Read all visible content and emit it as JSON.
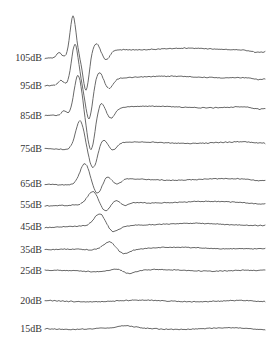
{
  "chart_data": {
    "type": "line",
    "title": "",
    "xlabel": "",
    "ylabel": "",
    "grid": false,
    "legend": "none",
    "series": [
      {
        "name": "105dB",
        "baseline_y": 58,
        "peak_x": 73,
        "peak_y": 17,
        "trough_x": 86,
        "trough_y": 92
      },
      {
        "name": "95dB",
        "baseline_y": 86,
        "peak_x": 75,
        "peak_y": 45,
        "trough_x": 89,
        "trough_y": 120
      },
      {
        "name": "85dB",
        "baseline_y": 116,
        "peak_x": 78,
        "peak_y": 75,
        "trough_x": 91,
        "trough_y": 150
      },
      {
        "name": "75dB",
        "baseline_y": 149,
        "peak_x": 80,
        "peak_y": 120,
        "trough_x": 93,
        "trough_y": 168
      },
      {
        "name": "65dB",
        "baseline_y": 184,
        "peak_x": 85,
        "peak_y": 163,
        "trough_x": 97,
        "trough_y": 195
      },
      {
        "name": "55dB",
        "baseline_y": 205,
        "peak_x": 93,
        "peak_y": 192,
        "trough_x": 105,
        "trough_y": 213
      },
      {
        "name": "45dB",
        "baseline_y": 227,
        "peak_x": 100,
        "peak_y": 214,
        "trough_x": 112,
        "trough_y": 233
      },
      {
        "name": "35dB",
        "baseline_y": 250,
        "peak_x": 110,
        "peak_y": 241,
        "trough_x": 122,
        "trough_y": 254
      },
      {
        "name": "25dB",
        "baseline_y": 271,
        "peak_x": 117,
        "peak_y": 268,
        "trough_x": 128,
        "trough_y": 274
      },
      {
        "name": "20dB",
        "baseline_y": 301,
        "peak_x": 0,
        "peak_y": 0,
        "trough_x": 0,
        "trough_y": 0
      },
      {
        "name": "15dB",
        "baseline_y": 329,
        "peak_x": 126,
        "peak_y": 327,
        "trough_x": 0,
        "trough_y": 0
      }
    ],
    "xlim": [
      45,
      265
    ]
  },
  "labels": [
    "105dB",
    "95dB",
    "85dB",
    "75dB",
    "65dB",
    "55dB",
    "45dB",
    "35dB",
    "25dB",
    "20dB",
    "15dB"
  ]
}
